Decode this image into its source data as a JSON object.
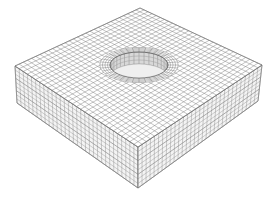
{
  "figure": {
    "background": "#ffffff",
    "colors": {
      "mesh_line": "#7a7a7a",
      "side_line": "#8a8a8a",
      "face_fill": "#ffffff",
      "side_fill": "#f4f4f4",
      "hole_fill": "#d8d8d8",
      "outline": "#5a5a5a"
    },
    "geometry": {
      "top_back": [
        140,
        8
      ],
      "top_right": [
        262,
        65
      ],
      "top_front": [
        138,
        147
      ],
      "top_left": [
        15,
        66
      ],
      "bottom_left": [
        17,
        103
      ],
      "bottom_front": [
        138,
        188
      ],
      "bottom_right": [
        258,
        101
      ],
      "hole_center": [
        139,
        65
      ],
      "hole_rx": 29,
      "hole_ry": 13,
      "hole_depth": 12
    },
    "mesh": {
      "top_divisions": 30,
      "side_vertical_divisions": 30,
      "side_layers": 9,
      "hole_radial_rings": 4,
      "hole_segments": 36
    }
  }
}
